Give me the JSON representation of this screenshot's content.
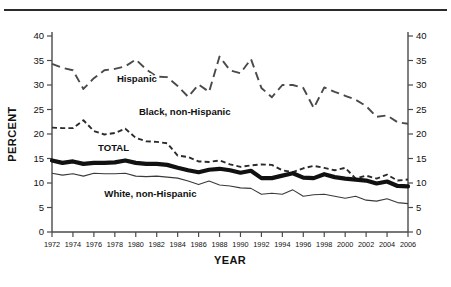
{
  "figure": {
    "has_top_rule": true,
    "ylabel": "PERCENT",
    "xlabel": "YEAR"
  },
  "chart_data": {
    "type": "line",
    "title": "",
    "xlabel": "YEAR",
    "ylabel": "PERCENT",
    "xlim": [
      1972,
      2006
    ],
    "ylim": [
      0,
      40
    ],
    "yticks": [
      0,
      5,
      10,
      15,
      20,
      25,
      30,
      35,
      40
    ],
    "ytick_labels": [
      "0",
      "5",
      "10",
      "15",
      "20",
      "25",
      "30",
      "35",
      "40"
    ],
    "right_axis": true,
    "right_yticks": [
      0,
      5,
      10,
      15,
      20,
      25,
      30,
      35,
      40
    ],
    "right_ytick_labels": [
      "0",
      "5",
      "10",
      "15",
      "20",
      "25",
      "30",
      "35",
      "40"
    ],
    "xticks": [
      1972,
      1974,
      1976,
      1978,
      1980,
      1982,
      1984,
      1986,
      1988,
      1990,
      1992,
      1994,
      1996,
      1998,
      2000,
      2002,
      2004,
      2006
    ],
    "xtick_labels": [
      "1972",
      "1974",
      "1976",
      "1978",
      "1980",
      "1982",
      "1984",
      "1986",
      "1988",
      "1990",
      "1992",
      "1994",
      "1996",
      "1998",
      "2000",
      "2002",
      "2004",
      "2006"
    ],
    "grid": false,
    "legend_position": "inline-annotations",
    "x": [
      1972,
      1973,
      1974,
      1975,
      1976,
      1977,
      1978,
      1979,
      1980,
      1981,
      1982,
      1983,
      1984,
      1985,
      1986,
      1987,
      1988,
      1989,
      1990,
      1991,
      1992,
      1993,
      1994,
      1995,
      1996,
      1997,
      1998,
      1999,
      2000,
      2001,
      2002,
      2003,
      2004,
      2005,
      2006
    ],
    "series": [
      {
        "name": "Hispanic",
        "style": "long-dashed",
        "label_x": 1978.2,
        "label_y": 30.6,
        "values": [
          34.3,
          33.5,
          33.0,
          29.2,
          31.4,
          33.0,
          33.3,
          33.8,
          35.2,
          33.2,
          31.7,
          31.6,
          29.8,
          27.6,
          30.1,
          28.6,
          35.8,
          33.0,
          32.4,
          35.3,
          29.4,
          27.5,
          30.0,
          30.0,
          29.4,
          25.3,
          29.5,
          28.6,
          27.8,
          27.0,
          25.7,
          23.5,
          23.8,
          22.4,
          22.1
        ]
      },
      {
        "name": "Black, non-Hispanic",
        "style": "short-dashed",
        "label_x": 1980.3,
        "label_y": 23.9,
        "values": [
          21.3,
          21.2,
          21.2,
          22.8,
          20.6,
          19.9,
          20.2,
          21.1,
          19.2,
          18.5,
          18.4,
          18.1,
          15.6,
          15.3,
          14.4,
          14.3,
          14.6,
          13.8,
          13.3,
          13.6,
          13.8,
          13.7,
          12.6,
          12.2,
          13.0,
          13.5,
          13.1,
          12.6,
          13.1,
          10.9,
          11.5,
          10.9,
          11.7,
          10.5,
          10.7
        ]
      },
      {
        "name": "TOTAL",
        "style": "thick-solid",
        "label_x": 1976.4,
        "label_y": 16.6,
        "values": [
          14.6,
          14.1,
          14.4,
          13.9,
          14.1,
          14.1,
          14.2,
          14.6,
          14.1,
          13.9,
          13.9,
          13.7,
          13.1,
          12.6,
          12.2,
          12.7,
          12.9,
          12.6,
          12.1,
          12.5,
          11.0,
          11.0,
          11.5,
          12.0,
          11.1,
          11.0,
          11.8,
          11.2,
          10.9,
          10.7,
          10.5,
          9.9,
          10.3,
          9.4,
          9.3
        ]
      },
      {
        "name": "White, non-Hispanic",
        "style": "thin-solid",
        "label_x": 1977.0,
        "label_y": 7.2,
        "values": [
          12.0,
          11.6,
          11.9,
          11.4,
          12.0,
          11.9,
          11.9,
          12.0,
          11.4,
          11.3,
          11.4,
          11.2,
          11.0,
          10.4,
          9.7,
          10.4,
          9.6,
          9.4,
          9.0,
          8.9,
          7.7,
          7.9,
          7.7,
          8.6,
          7.3,
          7.6,
          7.7,
          7.3,
          6.9,
          7.3,
          6.5,
          6.3,
          6.8,
          6.0,
          5.8
        ]
      }
    ]
  }
}
